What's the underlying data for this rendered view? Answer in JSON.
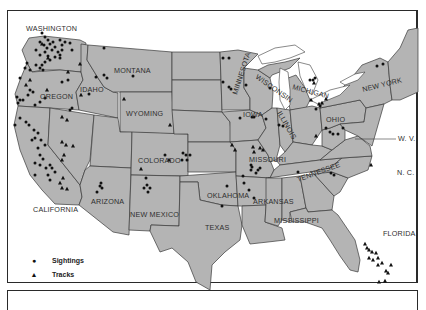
{
  "map": {
    "title": "",
    "region": "Contiguous United States",
    "background_color": "#ffffff",
    "land_color": "#b4b4b4",
    "border_color": "#3a3a3a",
    "marker_color": "#111111"
  },
  "labels": {
    "washington": "WASHINGTON",
    "oregon": "OREGON",
    "idaho": "IDAHO",
    "montana": "MONTANA",
    "wyoming": "WYOMING",
    "california": "CALIFORNIA",
    "arizona": "ARIZONA",
    "colorado": "COLORADO",
    "new_mexico": "NEW MEXICO",
    "texas": "TEXAS",
    "oklahoma": "OKLAHOMA",
    "arkansas": "ARKANSAS",
    "missouri": "MISSOURI",
    "iowa": "IOWA",
    "minnesota": "MINNESOTA",
    "wisconsin": "WISCONSIN",
    "illinois": "ILLINOIS",
    "michigan": "MICHIGAN",
    "ohio": "OHIO",
    "tennessee": "TENNESSEE",
    "mississippi": "MISSISSIPPI",
    "florida": "FLORIDA",
    "new_york": "NEW YORK",
    "west_virginia": "W. V.",
    "north_carolina": "N. C."
  },
  "legend": {
    "items": [
      {
        "symbol": "●",
        "shape": "circle",
        "label": "Sightings"
      },
      {
        "symbol": "▲",
        "shape": "triangle",
        "label": "Tracks"
      }
    ]
  },
  "markers": {
    "sightings": [
      [
        42,
        33
      ],
      [
        45,
        37
      ],
      [
        48,
        40
      ],
      [
        40,
        42
      ],
      [
        44,
        45
      ],
      [
        47,
        48
      ],
      [
        50,
        44
      ],
      [
        53,
        42
      ],
      [
        36,
        50
      ],
      [
        40,
        55
      ],
      [
        45,
        52
      ],
      [
        48,
        56
      ],
      [
        52,
        50
      ],
      [
        55,
        47
      ],
      [
        58,
        52
      ],
      [
        55,
        57
      ],
      [
        60,
        58
      ],
      [
        50,
        60
      ],
      [
        45,
        62
      ],
      [
        42,
        65
      ],
      [
        60,
        40
      ],
      [
        62,
        45
      ],
      [
        62,
        50
      ],
      [
        60,
        55
      ],
      [
        65,
        42
      ],
      [
        70,
        43
      ],
      [
        72,
        50
      ],
      [
        27,
        63
      ],
      [
        25,
        68
      ],
      [
        30,
        70
      ],
      [
        20,
        78
      ],
      [
        17,
        97
      ],
      [
        20,
        100
      ],
      [
        18,
        103
      ],
      [
        23,
        100
      ],
      [
        35,
        105
      ],
      [
        40,
        102
      ],
      [
        45,
        98
      ],
      [
        62,
        82
      ],
      [
        68,
        80
      ],
      [
        70,
        110
      ],
      [
        72,
        108
      ],
      [
        36,
        65
      ],
      [
        40,
        68
      ],
      [
        43,
        70
      ],
      [
        33,
        92
      ],
      [
        30,
        90
      ],
      [
        28,
        95
      ],
      [
        104,
        48
      ],
      [
        104,
        75
      ],
      [
        96,
        77
      ],
      [
        107,
        78
      ],
      [
        89,
        94
      ],
      [
        133,
        76
      ],
      [
        15,
        125
      ],
      [
        20,
        118
      ],
      [
        26,
        122
      ],
      [
        29,
        125
      ],
      [
        34,
        130
      ],
      [
        38,
        133
      ],
      [
        41,
        140
      ],
      [
        35,
        138
      ],
      [
        32,
        140
      ],
      [
        45,
        145
      ],
      [
        38,
        148
      ],
      [
        40,
        155
      ],
      [
        43,
        159
      ],
      [
        40,
        165
      ],
      [
        35,
        163
      ],
      [
        46,
        168
      ],
      [
        50,
        165
      ],
      [
        52,
        168
      ],
      [
        55,
        172
      ],
      [
        48,
        175
      ],
      [
        35,
        175
      ],
      [
        50,
        180
      ],
      [
        101,
        183
      ],
      [
        100,
        186
      ],
      [
        102,
        188
      ],
      [
        97,
        192
      ],
      [
        146,
        178
      ],
      [
        147,
        185
      ],
      [
        144,
        188
      ],
      [
        150,
        188
      ],
      [
        148,
        192
      ],
      [
        165,
        155
      ],
      [
        183,
        153
      ],
      [
        186,
        155
      ],
      [
        190,
        155
      ],
      [
        182,
        160
      ],
      [
        187,
        160
      ],
      [
        223,
        58
      ],
      [
        229,
        58
      ],
      [
        223,
        82
      ],
      [
        229,
        87
      ],
      [
        231,
        89
      ],
      [
        246,
        85
      ],
      [
        270,
        88
      ],
      [
        240,
        118
      ],
      [
        252,
        117
      ],
      [
        254,
        117
      ],
      [
        266,
        119
      ],
      [
        279,
        125
      ],
      [
        283,
        126
      ],
      [
        249,
        190
      ],
      [
        251,
        165
      ],
      [
        252,
        167
      ],
      [
        251,
        170
      ],
      [
        258,
        170
      ],
      [
        256,
        173
      ],
      [
        260,
        168
      ],
      [
        243,
        176
      ],
      [
        244,
        183
      ],
      [
        254,
        198
      ],
      [
        222,
        206
      ],
      [
        227,
        186
      ],
      [
        326,
        128
      ],
      [
        330,
        132
      ],
      [
        343,
        128
      ],
      [
        333,
        134
      ],
      [
        338,
        134
      ],
      [
        315,
        78
      ],
      [
        310,
        80
      ],
      [
        313,
        80
      ],
      [
        320,
        106
      ],
      [
        316,
        109
      ],
      [
        377,
        66
      ],
      [
        383,
        64
      ],
      [
        298,
        172
      ],
      [
        331,
        173
      ],
      [
        334,
        175
      ]
    ],
    "tracks": [
      [
        42,
        44
      ],
      [
        48,
        58
      ],
      [
        30,
        80
      ],
      [
        26,
        85
      ],
      [
        47,
        90
      ],
      [
        68,
        72
      ],
      [
        80,
        64
      ],
      [
        62,
        117
      ],
      [
        67,
        120
      ],
      [
        62,
        142
      ],
      [
        66,
        145
      ],
      [
        73,
        146
      ],
      [
        64,
        155
      ],
      [
        62,
        160
      ],
      [
        63,
        178
      ],
      [
        60,
        183
      ],
      [
        62,
        188
      ],
      [
        67,
        189
      ],
      [
        81,
        95
      ],
      [
        124,
        99
      ],
      [
        141,
        169
      ],
      [
        169,
        160
      ],
      [
        170,
        125
      ],
      [
        232,
        145
      ],
      [
        235,
        150
      ],
      [
        253,
        147
      ],
      [
        254,
        152
      ],
      [
        260,
        148
      ],
      [
        263,
        150
      ],
      [
        314,
        83
      ],
      [
        311,
        100
      ],
      [
        322,
        103
      ],
      [
        326,
        99
      ],
      [
        319,
        104
      ],
      [
        316,
        136
      ],
      [
        371,
        165
      ],
      [
        365,
        244
      ],
      [
        367,
        248
      ],
      [
        369,
        250
      ],
      [
        372,
        252
      ],
      [
        376,
        253
      ],
      [
        369,
        258
      ],
      [
        373,
        260
      ],
      [
        378,
        258
      ],
      [
        378,
        265
      ],
      [
        382,
        263
      ],
      [
        386,
        271
      ],
      [
        391,
        265
      ],
      [
        388,
        273
      ],
      [
        379,
        282
      ],
      [
        385,
        281
      ]
    ]
  }
}
